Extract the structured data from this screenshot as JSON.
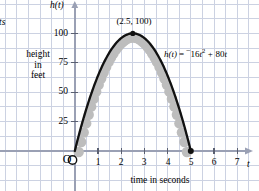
{
  "figure": {
    "title_axis_y": "h(t)",
    "title_axis_x": "t",
    "x_caption": "time in seconds",
    "y_caption_line1": "height",
    "y_caption_line2": "in",
    "y_caption_line3": "feet",
    "origin_marker": "O",
    "clipped_left_text": "ts",
    "colors": {
      "grid": "#c9cfe0",
      "axis": "#9aa0b4",
      "curve": "#111111",
      "shadow": "#bcbcbc",
      "text": "#000000",
      "background": "#ffffff"
    }
  },
  "chart_data": {
    "type": "line",
    "title": "",
    "subtitle": "",
    "xlabel": "time in seconds",
    "ylabel": "height in feet",
    "x_axis_symbol": "t",
    "y_axis_symbol": "h(t)",
    "xlim": [
      -0.75,
      7.9
    ],
    "ylim": [
      -24,
      118
    ],
    "xticks": [
      1,
      2,
      3,
      4,
      5,
      6,
      7
    ],
    "xtick_labels": [
      "1",
      "2",
      "3",
      "4",
      "5",
      "6",
      "7"
    ],
    "yticks": [
      25,
      50,
      75,
      100
    ],
    "ytick_labels": [
      "25",
      "50",
      "75",
      "100"
    ],
    "grid": true,
    "grid_spacing_x": 0.5,
    "grid_spacing_y": 12.5,
    "legend": null,
    "equation": "h(t) = -16t² + 80t",
    "equation_parts": {
      "lhs": "h(t)",
      "eq": "=",
      "neg": "−",
      "coef_a": "16",
      "var_sq": "t",
      "exp": "2",
      "plus": "+",
      "coef_b": "80",
      "var_b": "t"
    },
    "annotations": [
      {
        "text": "(2.5, 100)",
        "x": 2.5,
        "y": 100,
        "kind": "vertex-label"
      },
      {
        "text": "h(t) = ⁻16t² + 80t",
        "x": 5.1,
        "y": 84,
        "kind": "equation"
      }
    ],
    "points_of_interest": [
      {
        "label": "O",
        "x": 0,
        "y": 0,
        "marker": "open-circle"
      },
      {
        "label": "vertex",
        "x": 2.5,
        "y": 100,
        "marker": "filled-dot"
      },
      {
        "label": "landing",
        "x": 5,
        "y": 0,
        "marker": "filled-dot"
      }
    ],
    "series": [
      {
        "name": "h(t) = -16t^2 + 80t",
        "x": [
          0,
          0.25,
          0.5,
          0.75,
          1,
          1.25,
          1.5,
          1.75,
          2,
          2.25,
          2.5,
          2.75,
          3,
          3.25,
          3.5,
          3.75,
          4,
          4.25,
          4.5,
          4.75,
          5
        ],
        "values": [
          0,
          19,
          36,
          51,
          64,
          75,
          84,
          91,
          96,
          99,
          100,
          99,
          96,
          91,
          84,
          75,
          64,
          51,
          36,
          19,
          0
        ]
      }
    ]
  }
}
